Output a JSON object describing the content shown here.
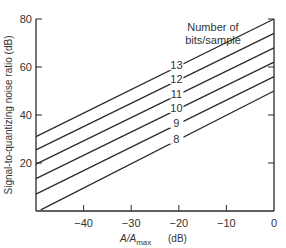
{
  "chart_data": {
    "type": "line",
    "title": "",
    "xlabel": "A/A_max (dB)",
    "xlabel_main": "A/A",
    "xlabel_sub": "max",
    "xlabel_unit": "(dB)",
    "ylabel": "Signal-to-quantizing noise ratio (dB)",
    "xlim": [
      -50,
      0
    ],
    "ylim": [
      0,
      80
    ],
    "x_ticks": [
      -40,
      -30,
      -20,
      -10,
      0
    ],
    "x_tick_labels": [
      "−40",
      "−30",
      "−20",
      "−10",
      "0"
    ],
    "y_ticks": [
      20,
      40,
      60,
      80
    ],
    "y_tick_labels": [
      "20",
      "40",
      "60",
      "80"
    ],
    "grid": false,
    "legend_title": [
      "Number of",
      "bits/sample"
    ],
    "legend_position": "inline labels, upper right",
    "series": [
      {
        "name": "13",
        "x": [
          -50,
          0
        ],
        "values": [
          31,
          80
        ]
      },
      {
        "name": "12",
        "x": [
          -50,
          0
        ],
        "values": [
          25.5,
          74
        ]
      },
      {
        "name": "11",
        "x": [
          -50,
          0
        ],
        "values": [
          19.5,
          68
        ]
      },
      {
        "name": "10",
        "x": [
          -50,
          0
        ],
        "values": [
          13.5,
          62
        ]
      },
      {
        "name": "9",
        "x": [
          -50,
          0
        ],
        "values": [
          7,
          56
        ]
      },
      {
        "name": "8",
        "x": [
          -49,
          0
        ],
        "values": [
          0.5,
          50
        ]
      }
    ]
  }
}
